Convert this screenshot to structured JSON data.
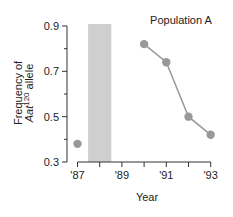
{
  "chart_data": {
    "type": "line",
    "title": "Population A",
    "xlabel": "Year",
    "ylabel_line1": "Frequency of",
    "ylabel_gene": "Aat",
    "ylabel_superscript": "120",
    "ylabel_suffix": " allele",
    "ylabel": "Frequency of Aat120 allele",
    "ylim": [
      0.3,
      0.9
    ],
    "xlim": [
      1987,
      1993
    ],
    "y_ticks": [
      0.3,
      0.5,
      0.7,
      0.9
    ],
    "y_minor_ticks": [
      0.4,
      0.6,
      0.8
    ],
    "y_tick_labels": [
      "0.3",
      "0.5",
      "0.7",
      "0.9"
    ],
    "x_ticks": [
      1987,
      1988,
      1989,
      1990,
      1991,
      1992,
      1993
    ],
    "x_tick_labels": [
      {
        "year": 1987,
        "label": "'87"
      },
      {
        "year": 1989,
        "label": "'89"
      },
      {
        "year": 1991,
        "label": "'91"
      },
      {
        "year": 1993,
        "label": "'93"
      }
    ],
    "grid": false,
    "shaded_region": {
      "x_start": 1987.5,
      "x_end": 1988.5,
      "color": "#cfcfcf"
    },
    "isolated_point": {
      "x": 1987,
      "y": 0.38
    },
    "series": [
      {
        "name": "Population A",
        "x": [
          1990,
          1991,
          1992,
          1993
        ],
        "values": [
          0.82,
          0.74,
          0.5,
          0.42
        ],
        "color": "#999999"
      }
    ]
  }
}
